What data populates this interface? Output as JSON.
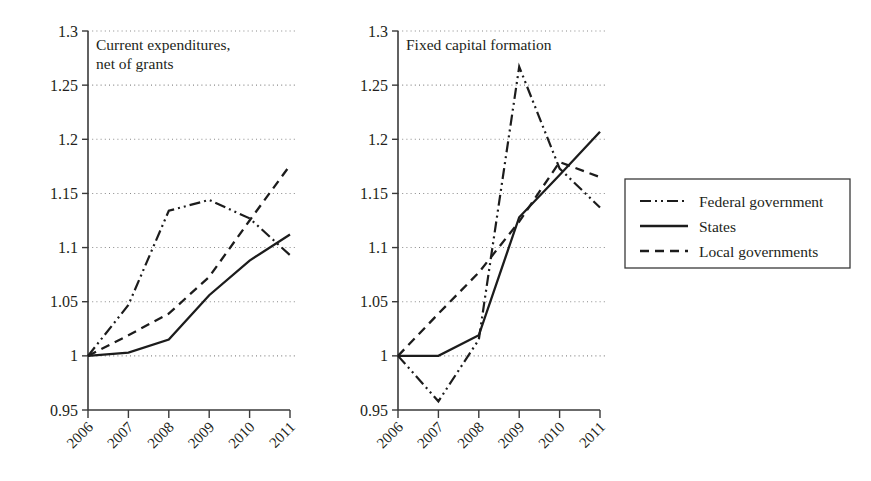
{
  "figure": {
    "background_color": "#ffffff",
    "ink_color": "#231f20",
    "line_color": "#1c1c1c",
    "grid_color": "#8a8a8a"
  },
  "legend": {
    "name": "series-legend",
    "position": "right",
    "entries": [
      {
        "label": "Federal government",
        "style": "dash-dot-dot"
      },
      {
        "label": "States",
        "style": "solid"
      },
      {
        "label": "Local governments",
        "style": "dashed"
      }
    ]
  },
  "chart_data": [
    {
      "type": "line",
      "panel": "left",
      "title": "Current expenditures,\nnet of grants",
      "title_lines": [
        "Current expenditures,",
        "net of grants"
      ],
      "xlabel": "",
      "ylabel": "",
      "x": [
        2006,
        2007,
        2008,
        2009,
        2010,
        2011
      ],
      "categories": [
        "2006",
        "2007",
        "2008",
        "2009",
        "2010",
        "2011"
      ],
      "xtick_labels": [
        "2006",
        "2007",
        "2008",
        "2009",
        "2010",
        "2011"
      ],
      "ytick_labels": [
        "0.95",
        "1",
        "1.05",
        "1.1",
        "1.15",
        "1.2",
        "1.25",
        "1.3"
      ],
      "ytick_values": [
        0.95,
        1.0,
        1.05,
        1.1,
        1.15,
        1.2,
        1.25,
        1.3
      ],
      "ylim": [
        0.95,
        1.3
      ],
      "xlim": [
        2006,
        2011
      ],
      "grid": true,
      "grid_axis": "y",
      "series": [
        {
          "name": "Federal government",
          "style": "dash-dot-dot",
          "values": [
            1.0,
            1.047,
            1.134,
            1.144,
            1.127,
            1.093
          ]
        },
        {
          "name": "States",
          "style": "solid",
          "values": [
            1.0,
            1.003,
            1.015,
            1.056,
            1.088,
            1.112
          ]
        },
        {
          "name": "Local governments",
          "style": "dashed",
          "values": [
            1.0,
            1.019,
            1.039,
            1.073,
            1.125,
            1.176
          ]
        }
      ]
    },
    {
      "type": "line",
      "panel": "right",
      "title": "Fixed capital formation",
      "title_lines": [
        "Fixed capital formation"
      ],
      "xlabel": "",
      "ylabel": "",
      "x": [
        2006,
        2007,
        2008,
        2009,
        2010,
        2011
      ],
      "categories": [
        "2006",
        "2007",
        "2008",
        "2009",
        "2010",
        "2011"
      ],
      "xtick_labels": [
        "2006",
        "2007",
        "2008",
        "2009",
        "2010",
        "2011"
      ],
      "ytick_labels": [
        "0.95",
        "1",
        "1.05",
        "1.1",
        "1.15",
        "1.2",
        "1.25",
        "1.3"
      ],
      "ytick_values": [
        0.95,
        1.0,
        1.05,
        1.1,
        1.15,
        1.2,
        1.25,
        1.3
      ],
      "ylim": [
        0.95,
        1.3
      ],
      "xlim": [
        2006,
        2011
      ],
      "grid": true,
      "grid_axis": "y",
      "series": [
        {
          "name": "Federal government",
          "style": "dash-dot-dot",
          "values": [
            1.0,
            0.958,
            1.015,
            1.267,
            1.173,
            1.137
          ]
        },
        {
          "name": "States",
          "style": "solid",
          "values": [
            1.0,
            1.0,
            1.019,
            1.128,
            1.167,
            1.207
          ]
        },
        {
          "name": "Local governments",
          "style": "dashed",
          "values": [
            1.0,
            1.039,
            1.077,
            1.124,
            1.179,
            1.165
          ]
        }
      ]
    }
  ]
}
